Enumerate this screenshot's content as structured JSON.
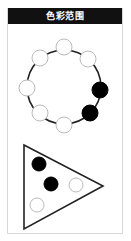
{
  "header": {
    "title": "色彩范围"
  },
  "colors": {
    "header_bg": "#111111",
    "header_text": "#ffffff",
    "filled": "#000000",
    "empty_fill": "#ffffff",
    "empty_stroke": "#bbbbbb",
    "line": "#222222",
    "panel_border": "#d8d8d8"
  },
  "ring": {
    "center": [
      64,
      87
    ],
    "radius": 37,
    "dot_radius": 8,
    "dots": [
      {
        "position": "top",
        "x": 64,
        "y": 47,
        "filled": false
      },
      {
        "position": "upper-right",
        "x": 88,
        "y": 59,
        "filled": false
      },
      {
        "position": "right",
        "x": 100,
        "y": 90,
        "filled": true
      },
      {
        "position": "lower-right",
        "x": 90,
        "y": 113,
        "filled": true
      },
      {
        "position": "bottom",
        "x": 64,
        "y": 125,
        "filled": false
      },
      {
        "position": "lower-left",
        "x": 40,
        "y": 113,
        "filled": false
      },
      {
        "position": "left",
        "x": 27,
        "y": 88,
        "filled": false
      },
      {
        "position": "upper-left",
        "x": 40,
        "y": 58,
        "filled": false
      }
    ]
  },
  "triangle": {
    "vertices": [
      [
        24,
        145
      ],
      [
        103,
        186
      ],
      [
        24,
        229
      ]
    ],
    "dot_radius": 7,
    "dots": [
      {
        "x": 39,
        "y": 164,
        "filled": true
      },
      {
        "x": 51,
        "y": 184,
        "filled": true
      },
      {
        "x": 76,
        "y": 185,
        "filled": false
      },
      {
        "x": 37,
        "y": 205,
        "filled": false
      }
    ]
  }
}
